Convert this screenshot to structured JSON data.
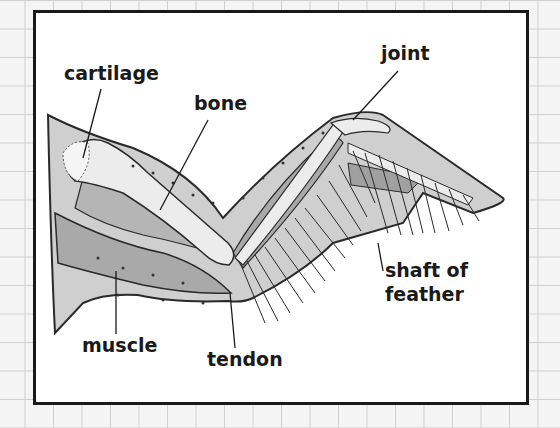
{
  "diagram": {
    "labels": {
      "cartilage": "cartilage",
      "bone": "bone",
      "joint": "joint",
      "shaft_line1": "shaft of",
      "shaft_line2": "feather",
      "muscle": "muscle",
      "tendon": "tendon"
    },
    "colors": {
      "background": "#f4f4f4",
      "grid": "#cfcfcf",
      "frame_border": "#1a1a1a",
      "skin_fill": "#cfcfcf",
      "muscle_fill": "#a9a9a9",
      "bone_fill": "#ececec",
      "outline": "#2a2a2a"
    }
  }
}
